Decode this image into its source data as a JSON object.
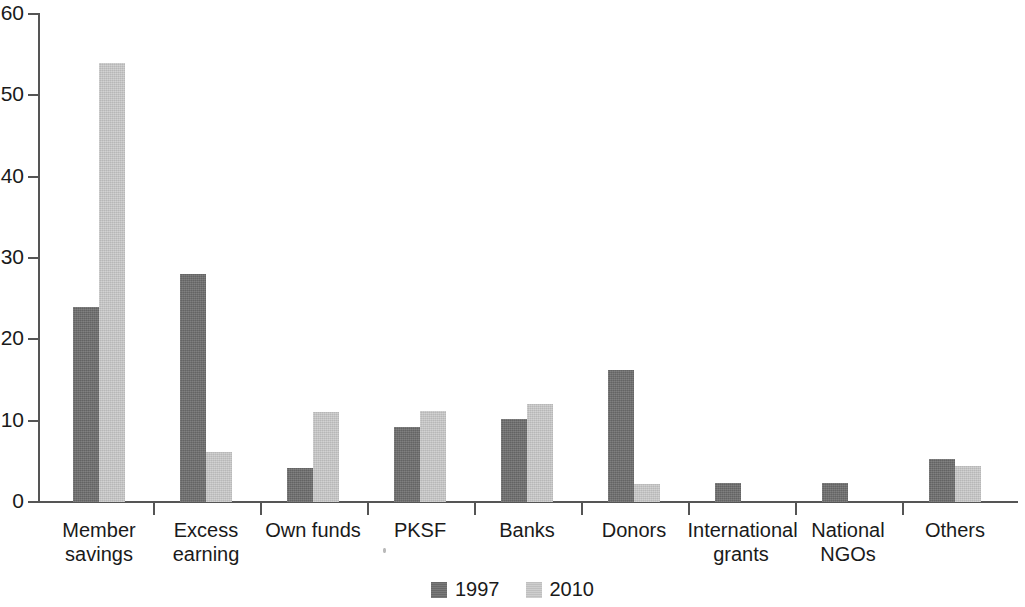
{
  "chart_data": {
    "type": "bar",
    "title": "",
    "subtitle": "",
    "xlabel": "",
    "ylabel": "",
    "ylim": [
      0,
      60
    ],
    "ytick_step": 10,
    "yticks": [
      0,
      10,
      20,
      30,
      40,
      50,
      60
    ],
    "ytick_labels": [
      "0",
      "10",
      "20",
      "30",
      "40",
      "50",
      "60"
    ],
    "grid": false,
    "legend_position": "bottom-center",
    "categories": [
      "Member\nsavings",
      "Excess\nearning",
      "Own funds",
      "PKSF",
      "Banks",
      "Donors",
      "International\ngrants",
      "National\nNGOs",
      "Others"
    ],
    "series": [
      {
        "name": "1997",
        "color": "#6f6f6f",
        "values": [
          24,
          28,
          4.2,
          9.2,
          10.2,
          16.2,
          2.3,
          2.3,
          5.3
        ]
      },
      {
        "name": "2010",
        "color": "#c9c9c9",
        "values": [
          54,
          6.1,
          11.1,
          11.2,
          12.1,
          2.2,
          0,
          0,
          4.4
        ]
      }
    ],
    "annotations": []
  },
  "legend": {
    "items": [
      {
        "label": "1997",
        "series": "s1997"
      },
      {
        "label": "2010",
        "series": "s2010"
      }
    ]
  },
  "axis": {
    "y_axis_color": "#555555",
    "x_axis_color": "#555555"
  }
}
